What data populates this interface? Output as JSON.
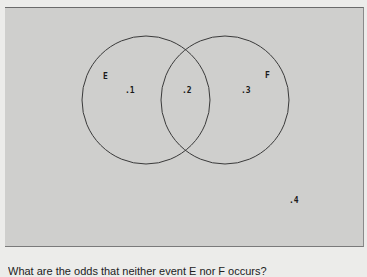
{
  "diagram": {
    "type": "venn",
    "sets": [
      {
        "label": "E",
        "center": [
          141,
          92
        ],
        "radius": 64
      },
      {
        "label": "F",
        "center": [
          220,
          92
        ],
        "radius": 64
      }
    ],
    "regions": [
      {
        "id": "E_only",
        "value": ".1"
      },
      {
        "id": "E_and_F",
        "value": ".2"
      },
      {
        "id": "F_only",
        "value": ".3"
      },
      {
        "id": "outside",
        "value": ".4"
      }
    ]
  },
  "caption": {
    "text": "What are the odds that neither event E nor F occurs?"
  }
}
